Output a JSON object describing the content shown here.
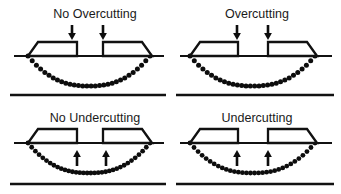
{
  "figure": {
    "title_present": false,
    "background_color": "#ffffff",
    "ink_color": "#111111",
    "grid": {
      "rows": 2,
      "columns": 2
    }
  },
  "panels": [
    {
      "id": "no-overcutting",
      "label": "No Overcutting",
      "label_x": 95,
      "label_y": 18,
      "arrow_direction": "down",
      "arrow_glyph": "downward-arrow",
      "substrate_line": {
        "x1": 14,
        "x2": 164,
        "y": 56
      },
      "base_rule": {
        "x1": 10,
        "x2": 166,
        "y": 95
      },
      "masks": [
        {
          "side": "left",
          "outer_x": 28,
          "inner_x": 77,
          "top_y": 42,
          "bottom_y": 56,
          "bevel": 10
        },
        {
          "side": "right",
          "outer_x": 152,
          "inner_x": 103,
          "top_y": 42,
          "bottom_y": 56,
          "bevel": 10
        }
      ],
      "arrows": [
        {
          "x": 72,
          "tip_y": 40,
          "tail_y": 25
        },
        {
          "x": 103,
          "tip_y": 40,
          "tail_y": 25
        }
      ],
      "etch_curve": {
        "x_start": 28,
        "x_end": 150,
        "y_top": 56,
        "depth": 30,
        "dots": 30,
        "dot_radius": 2.5
      }
    },
    {
      "id": "overcutting",
      "label": "Overcutting",
      "label_x": 257,
      "label_y": 18,
      "arrow_direction": "down",
      "arrow_glyph": "downward-arrow",
      "substrate_line": {
        "x1": 180,
        "x2": 332,
        "y": 56
      },
      "base_rule": {
        "x1": 176,
        "x2": 334,
        "y": 95
      },
      "masks": [
        {
          "side": "left",
          "outer_x": 190,
          "inner_x": 238,
          "top_y": 42,
          "bottom_y": 56,
          "bevel": 10
        },
        {
          "side": "right",
          "outer_x": 317,
          "inner_x": 268,
          "top_y": 42,
          "bottom_y": 56,
          "bevel": 10
        }
      ],
      "arrows": [
        {
          "x": 237,
          "tip_y": 40,
          "tail_y": 25
        },
        {
          "x": 268,
          "tip_y": 40,
          "tail_y": 25
        }
      ],
      "etch_curve": {
        "x_start": 190,
        "x_end": 315,
        "y_top": 56,
        "depth": 30,
        "dots": 30,
        "dot_radius": 2.5
      }
    },
    {
      "id": "no-undercutting",
      "label": "No Undercutting",
      "label_x": 95,
      "label_y": 122,
      "arrow_direction": "up",
      "arrow_glyph": "upward-arrow",
      "substrate_line": {
        "x1": 14,
        "x2": 164,
        "y": 143
      },
      "base_rule": {
        "x1": 10,
        "x2": 166,
        "y": 184
      },
      "masks": [
        {
          "side": "left",
          "outer_x": 28,
          "inner_x": 77,
          "top_y": 129,
          "bottom_y": 143,
          "bevel": 10
        },
        {
          "side": "right",
          "outer_x": 152,
          "inner_x": 103,
          "top_y": 129,
          "bottom_y": 143,
          "bevel": 10
        }
      ],
      "arrows": [
        {
          "x": 77,
          "tip_y": 150,
          "tail_y": 166
        },
        {
          "x": 106,
          "tip_y": 150,
          "tail_y": 166
        }
      ],
      "etch_curve": {
        "x_start": 28,
        "x_end": 150,
        "y_top": 143,
        "depth": 30,
        "dots": 34,
        "dot_radius": 2.4
      }
    },
    {
      "id": "undercutting",
      "label": "Undercutting",
      "label_x": 257,
      "label_y": 122,
      "arrow_direction": "up",
      "arrow_glyph": "upward-arrow",
      "substrate_line": {
        "x1": 180,
        "x2": 332,
        "y": 143
      },
      "base_rule": {
        "x1": 176,
        "x2": 334,
        "y": 184
      },
      "masks": [
        {
          "side": "left",
          "outer_x": 190,
          "inner_x": 238,
          "top_y": 129,
          "bottom_y": 143,
          "bevel": 10
        },
        {
          "side": "right",
          "outer_x": 317,
          "inner_x": 268,
          "top_y": 129,
          "bottom_y": 143,
          "bevel": 10
        }
      ],
      "arrows": [
        {
          "x": 237,
          "tip_y": 150,
          "tail_y": 166
        },
        {
          "x": 268,
          "tip_y": 150,
          "tail_y": 166
        }
      ],
      "etch_curve": {
        "x_start": 190,
        "x_end": 315,
        "y_top": 143,
        "depth": 30,
        "dots": 32,
        "dot_radius": 2.4
      }
    }
  ]
}
